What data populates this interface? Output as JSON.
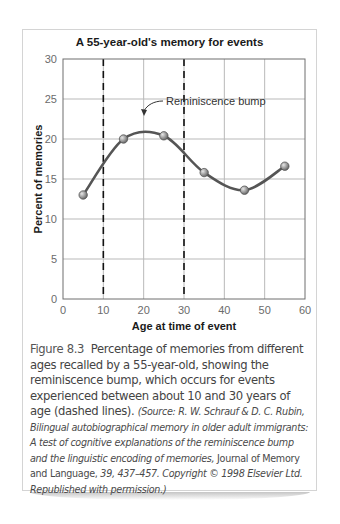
{
  "chart_data": {
    "type": "line",
    "title": "A 55-year-old's memory for events",
    "xlabel": "Age at time of event",
    "ylabel": "Percent of memories",
    "x": [
      5,
      15,
      25,
      35,
      45,
      55
    ],
    "series": [
      {
        "name": "Percent of memories",
        "values": [
          13.0,
          20.0,
          20.4,
          15.8,
          13.6,
          16.6
        ]
      }
    ],
    "xlim": [
      0,
      60
    ],
    "ylim": [
      0,
      30
    ],
    "xticks": [
      "0",
      "10",
      "20",
      "30",
      "40",
      "50",
      "60"
    ],
    "yticks": [
      "0",
      "5",
      "10",
      "15",
      "20",
      "25",
      "30"
    ],
    "grid": true,
    "smoothed_curve": true,
    "reference_lines": [
      {
        "x": 10,
        "style": "dashed"
      },
      {
        "x": 30,
        "style": "dashed"
      }
    ],
    "annotations": [
      {
        "text": "Reminiscence bump",
        "arrow_to": {
          "x": 20,
          "y": 22.5
        }
      }
    ],
    "line_color": "#555555",
    "marker_color": "#8a8a8a"
  },
  "figure": {
    "title": "A 55-year-old's memory for events",
    "caption": {
      "label": "Figure 8.3",
      "text": "Percentage of memories from different ages recalled by a 55-year-old, showing the reminiscence bump, which occurs for events experienced between about 10 and 30 years of age (dashed lines).",
      "source_prefix": "(Source: R. W. Schrauf & D. C. Rubin,",
      "source_title": "Bilingual autobiographical memory in older adult immigrants: A test of cognitive explanations of the reminiscence bump and the linguistic encoding of memories,",
      "source_journal": "Journal of Memory and Language,",
      "source_suffix": "39, 437–457. Copyright © 1998 Elsevier Ltd. Republished with permission.)"
    }
  }
}
